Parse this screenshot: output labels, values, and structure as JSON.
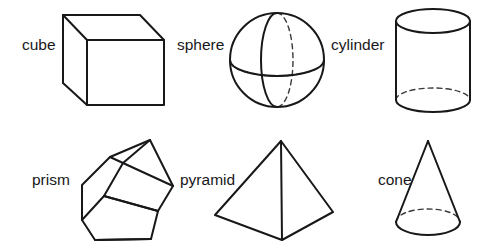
{
  "figure": {
    "background_color": "#ffffff",
    "line_color": "#18181a",
    "hidden_line_color": "#3a3a3d",
    "width": 493,
    "height": 250
  },
  "shapes": [
    {
      "key": "cube",
      "label": "cube",
      "row": 1,
      "column": 1,
      "icon": "cube-icon",
      "label_x": 22,
      "label_y": 50
    },
    {
      "key": "sphere",
      "label": "sphere",
      "row": 1,
      "column": 2,
      "icon": "sphere-icon",
      "label_x": 177,
      "label_y": 50
    },
    {
      "key": "cylinder",
      "label": "cylinder",
      "row": 1,
      "column": 3,
      "icon": "cylinder-icon",
      "label_x": 331,
      "label_y": 50
    },
    {
      "key": "prism",
      "label": "prism",
      "row": 2,
      "column": 1,
      "icon": "prism-icon",
      "label_x": 32,
      "label_y": 185
    },
    {
      "key": "pyramid",
      "label": "pyramid",
      "row": 2,
      "column": 2,
      "icon": "pyramid-icon",
      "label_x": 180,
      "label_y": 185
    },
    {
      "key": "cone",
      "label": "cone",
      "row": 2,
      "column": 3,
      "icon": "cone-icon",
      "label_x": 378,
      "label_y": 185
    }
  ]
}
